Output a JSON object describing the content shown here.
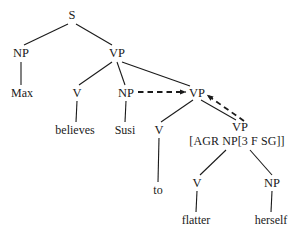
{
  "figure": {
    "background_color": "#ffffff",
    "line_color": "#1a1a1a",
    "width": 306,
    "height": 240
  },
  "nodes": {
    "s": "S",
    "np_subject": "NP",
    "max": "Max",
    "vp_matrix": "VP",
    "v_matrix": "V",
    "believes": "believes",
    "np_object": "NP",
    "susi": "Susi",
    "vp_embedded": "VP",
    "v_to": "V",
    "to": "to",
    "vp_inner": "VP",
    "agr_features": "[AGR NP[3 F SG]]",
    "v_flatter": "V",
    "flatter": "flatter",
    "np_reflexive": "NP",
    "herself": "herself"
  },
  "links": {
    "np_to_vp_dashed": "dashed-arrow-np-to-vp",
    "vp_inner_to_vp_dashed": "dashed-arrow-vp-inner-to-vp"
  }
}
